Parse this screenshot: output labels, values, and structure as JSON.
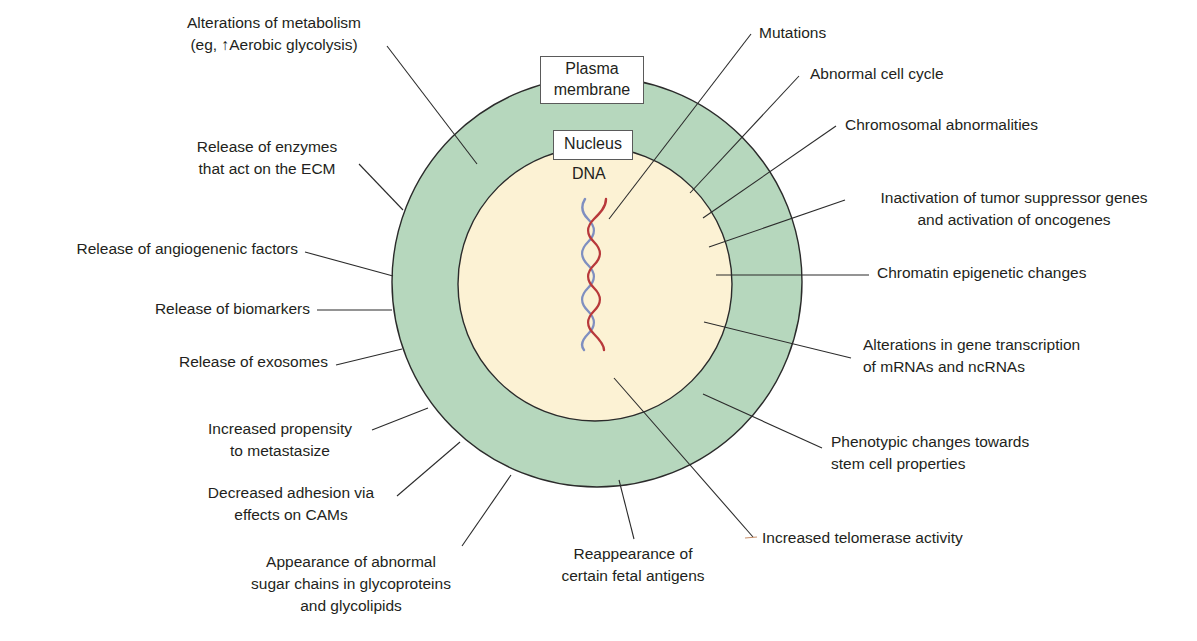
{
  "colors": {
    "membrane_ring": "#b6d7bd",
    "nucleus_fill": "#fcf2d4",
    "outline": "#2b2b2b",
    "dna_strand_red": "#b8393b",
    "dna_strand_blue": "#7f8fc0",
    "leader_line": "#2b2b2b"
  },
  "structures": {
    "plasma_membrane": {
      "line1": "Plasma",
      "line2": "membrane"
    },
    "nucleus": "Nucleus",
    "dna": "DNA"
  },
  "left_labels": {
    "metabolism": {
      "line1": "Alterations of metabolism",
      "line2": "(eg, ↑Aerobic glycolysis)"
    },
    "enzymes": {
      "line1": "Release of enzymes",
      "line2": "that act on the ECM"
    },
    "angiogenic": "Release of angiogenenic factors",
    "biomarkers": "Release of biomarkers",
    "exosomes": "Release of exosomes",
    "metastasize": {
      "line1": "Increased propensity",
      "line2": "to metastasize"
    },
    "adhesion": {
      "line1": "Decreased adhesion via",
      "line2": "effects on CAMs"
    },
    "sugar_chains": {
      "line1": "Appearance of abnormal",
      "line2": "sugar chains in glycoproteins",
      "line3": "and glycolipids"
    }
  },
  "right_labels": {
    "mutations": "Mutations",
    "cell_cycle": "Abnormal cell cycle",
    "chromosomal": "Chromosomal abnormalities",
    "tumor_suppressor": {
      "line1": "Inactivation of tumor suppressor genes",
      "line2": "and activation of oncogenes"
    },
    "chromatin": "Chromatin epigenetic changes",
    "transcription": {
      "line1": "Alterations in gene transcription",
      "line2": "of mRNAs and ncRNAs"
    },
    "phenotypic": {
      "line1": "Phenotypic changes towards",
      "line2": "stem cell properties"
    },
    "telomerase": "Increased telomerase activity"
  },
  "bottom_labels": {
    "fetal_antigens": {
      "line1": "Reappearance of",
      "line2": "certain fetal antigens"
    }
  }
}
